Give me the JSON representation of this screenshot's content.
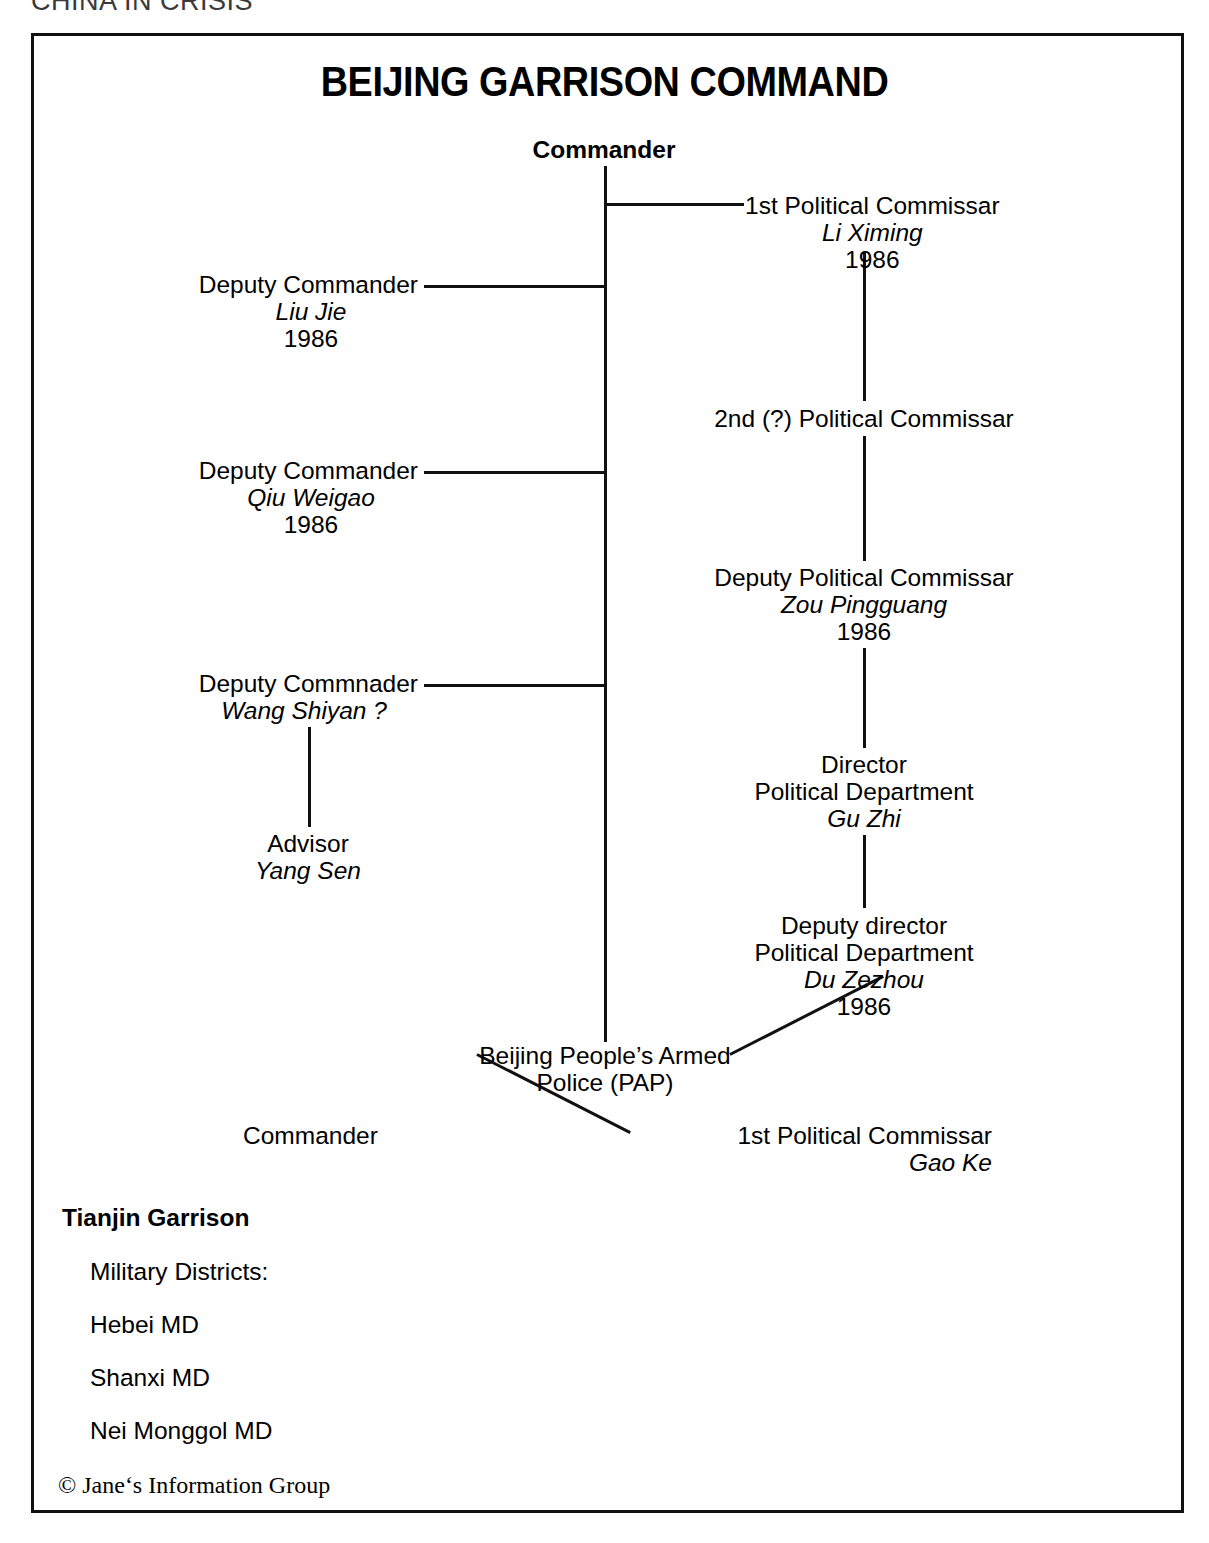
{
  "running_head": "CHINA IN CRISIS",
  "chart_title": "BEIJING GARRISON COMMAND",
  "nodes": {
    "commander": {
      "role": "Commander"
    },
    "first_political_commissar": {
      "role": "1st Political Commissar",
      "name": "Li Ximing",
      "year": "1986"
    },
    "deputy_commander_1": {
      "role": "Deputy Commander",
      "name": "Liu Jie",
      "year": "1986"
    },
    "second_political_commissar": {
      "role": "2nd (?) Political Commissar"
    },
    "deputy_commander_2": {
      "role": "Deputy Commander",
      "name": "Qiu Weigao",
      "year": "1986"
    },
    "deputy_political_commissar": {
      "role": "Deputy Political Commissar",
      "name": "Zou Pingguang",
      "year": "1986"
    },
    "deputy_commander_3": {
      "role": "Deputy Commnader",
      "name": "Wang Shiyan ?"
    },
    "director_political_department": {
      "role": "Director",
      "role2": "Political Department",
      "name": "Gu Zhi"
    },
    "advisor": {
      "role": "Advisor",
      "name": "Yang Sen"
    },
    "deputy_director_political_department": {
      "role": "Deputy director",
      "role2": "Political Department",
      "name": "Du Zezhou",
      "year": "1986"
    },
    "pap": {
      "role": "Beijing People’s Armed",
      "role2": "Police (PAP)"
    },
    "pap_commander": {
      "role": "Commander"
    },
    "pap_first_political_commissar": {
      "role": "1st Political Commissar",
      "name": "Gao Ke"
    }
  },
  "footer": {
    "tianjin_garrison": "Tianjin Garrison",
    "military_districts_label": "Military Districts:",
    "districts": [
      "Hebei MD",
      "Shanxi MD",
      "Nei Monggol MD"
    ]
  },
  "copyright": "© Jane‘s Information Group",
  "colors": {
    "ink": "#111111",
    "paper": "#ffffff"
  }
}
